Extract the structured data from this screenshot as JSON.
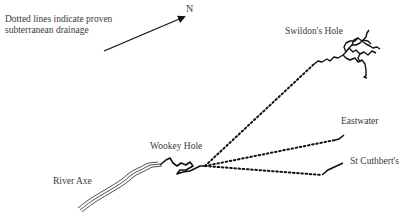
{
  "legend": {
    "note": "Dotted lines indicate proven subterranean drainage"
  },
  "compass": {
    "label": "N",
    "icon": "north-arrow-icon"
  },
  "locations": {
    "swildons": "Swildon's Hole",
    "eastwater": "Eastwater",
    "stcuthberts": "St Cuthbert's",
    "wookey": "Wookey Hole",
    "axe": "River Axe"
  },
  "style": {
    "line_color": "#111111",
    "text_color": "#3a3a3a",
    "background": "#ffffff"
  }
}
